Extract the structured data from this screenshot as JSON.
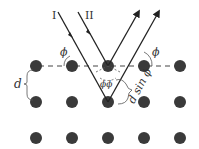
{
  "diagram": {
    "labels": {
      "ray_1": "I",
      "ray_2": "II",
      "angle_left": "ϕ",
      "angle_right": "ϕ",
      "angle_inner": "ϕϕ",
      "spacing": "d",
      "path_difference": "d sin ϕ"
    },
    "lattice": {
      "rows": 3,
      "columns": 5,
      "dot_color": "#3a3a3a",
      "columns_x": [
        36,
        72,
        108,
        144,
        180
      ],
      "rows_y": [
        66,
        102,
        138
      ]
    },
    "colors": {
      "line": "#222222",
      "dashed": "#444444"
    }
  }
}
